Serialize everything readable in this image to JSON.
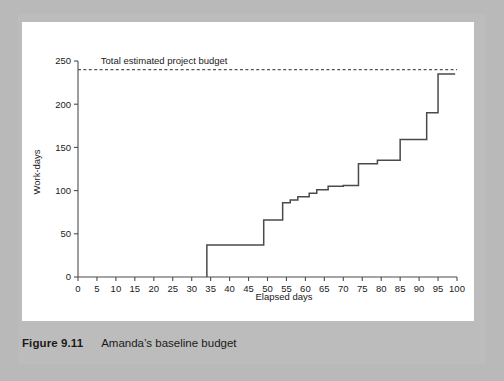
{
  "figure": {
    "caption_label": "Figure 9.11",
    "caption_text": "Amanda’s baseline budget"
  },
  "chart_data": {
    "type": "line",
    "subtype": "step",
    "title": "",
    "xlabel": "Elapsed days",
    "ylabel": "Work-days",
    "xlim": [
      0,
      100
    ],
    "ylim": [
      0,
      250
    ],
    "grid": false,
    "legend": null,
    "xticks": [
      0,
      5,
      10,
      15,
      20,
      25,
      30,
      35,
      40,
      45,
      50,
      55,
      60,
      65,
      70,
      75,
      80,
      85,
      90,
      95,
      100
    ],
    "xtick_labels": [
      "0",
      "5",
      "10",
      "15",
      "20",
      "25",
      "30",
      "35",
      "40",
      "45",
      "50",
      "55",
      "60",
      "65",
      "70",
      "75",
      "80",
      "85",
      "90",
      "95",
      "100"
    ],
    "yticks": [
      0,
      50,
      100,
      150,
      200,
      250
    ],
    "ytick_labels": [
      "0",
      "50",
      "100",
      "150",
      "200",
      "250"
    ],
    "annotations": [
      {
        "name": "total-estimated-project-budget",
        "text": "Total estimated project budget",
        "type": "horizontal-threshold-line",
        "y": 240,
        "style": "dashed",
        "color": "#555555",
        "label_x": 6,
        "label_y": 247
      }
    ],
    "series": [
      {
        "name": "Cumulative baseline budget",
        "color": "#4a4a4a",
        "step": "post",
        "x": [
          34,
          34,
          49,
          49,
          54,
          54,
          56,
          56,
          58,
          58,
          61,
          61,
          63,
          63,
          66,
          66,
          70,
          70,
          74,
          74,
          79,
          79,
          85,
          85,
          92,
          92,
          95,
          95,
          99.5
        ],
        "y": [
          0,
          37,
          37,
          66,
          66,
          86,
          86,
          89,
          89,
          93,
          93,
          97,
          97,
          101,
          101,
          105,
          105,
          106,
          106,
          131,
          131,
          135,
          135,
          159,
          159,
          190,
          190,
          235,
          235
        ]
      }
    ]
  }
}
